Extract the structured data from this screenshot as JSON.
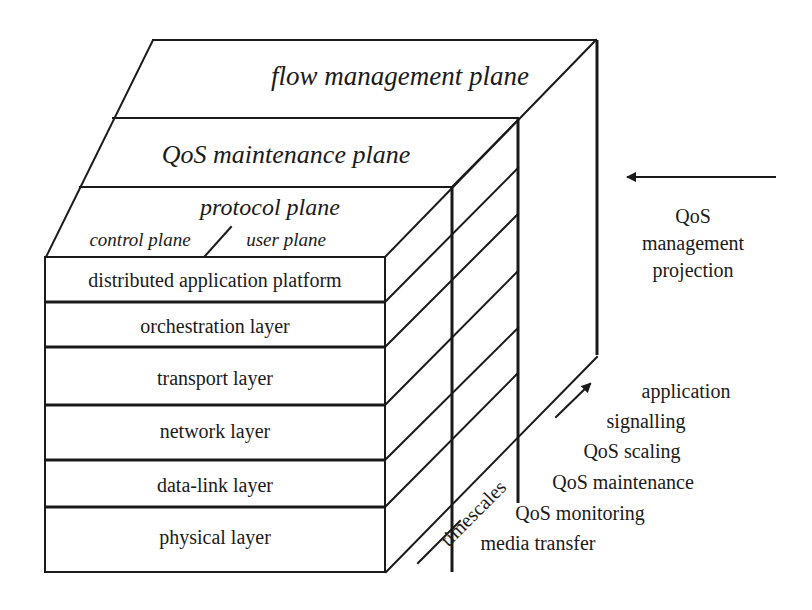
{
  "diagram": {
    "top_planes": {
      "flow_management": "flow management plane",
      "qos_maintenance": "QoS maintenance plane",
      "protocol": "protocol plane",
      "control": "control plane",
      "user": "user plane",
      "separator": "/"
    },
    "layers": [
      "distributed application platform",
      "orchestration layer",
      "transport layer",
      "network layer",
      "data-link layer",
      "physical layer"
    ],
    "projection": {
      "line1": "QoS",
      "line2": "management",
      "line3": "projection"
    },
    "timescales": {
      "axis_label": "timescales",
      "items": [
        "application",
        "signalling",
        "QoS scaling",
        "QoS maintenance",
        "QoS monitoring",
        "media transfer"
      ]
    },
    "colors": {
      "line": "#1a1a1a",
      "background": "#ffffff"
    }
  }
}
